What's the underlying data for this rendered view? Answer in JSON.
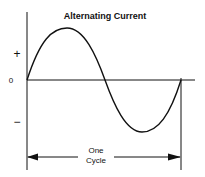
{
  "title": "Alternating Current",
  "labels": {
    "plus": "+",
    "zero": "0",
    "minus": "−",
    "cycle_line1": "One",
    "cycle_line2": "Cycle"
  },
  "colors": {
    "ink": "#111111",
    "background": "#ffffff"
  }
}
